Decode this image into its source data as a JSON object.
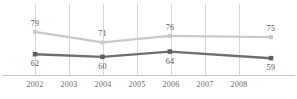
{
  "chart_data": {
    "type": "line",
    "title": "",
    "subtitle": "",
    "xlabel": "",
    "ylabel": "",
    "grid": "vertical",
    "legend": "none",
    "xlim": [
      2002,
      2009
    ],
    "ylim": [
      50,
      85
    ],
    "tick_labels": [
      "2002",
      "2003",
      "2004",
      "2005",
      "2006",
      "2007",
      "2008"
    ],
    "x": [
      2002,
      2004,
      2006,
      2009
    ],
    "series": [
      {
        "name": "upper-series",
        "color": "#c9c9c9",
        "values": [
          79,
          71,
          76,
          75
        ],
        "labels": [
          "79",
          "71",
          "76",
          "75"
        ],
        "label_position": "above"
      },
      {
        "name": "lower-series",
        "color": "#6e6e6e",
        "values": [
          62,
          60,
          64,
          59
        ],
        "labels": [
          "62",
          "60",
          "64",
          "59"
        ],
        "label_position": "below"
      }
    ],
    "axis_color": "#c4c4c4",
    "gridline_color": "#d7d7d7",
    "background": "#ffffff"
  }
}
